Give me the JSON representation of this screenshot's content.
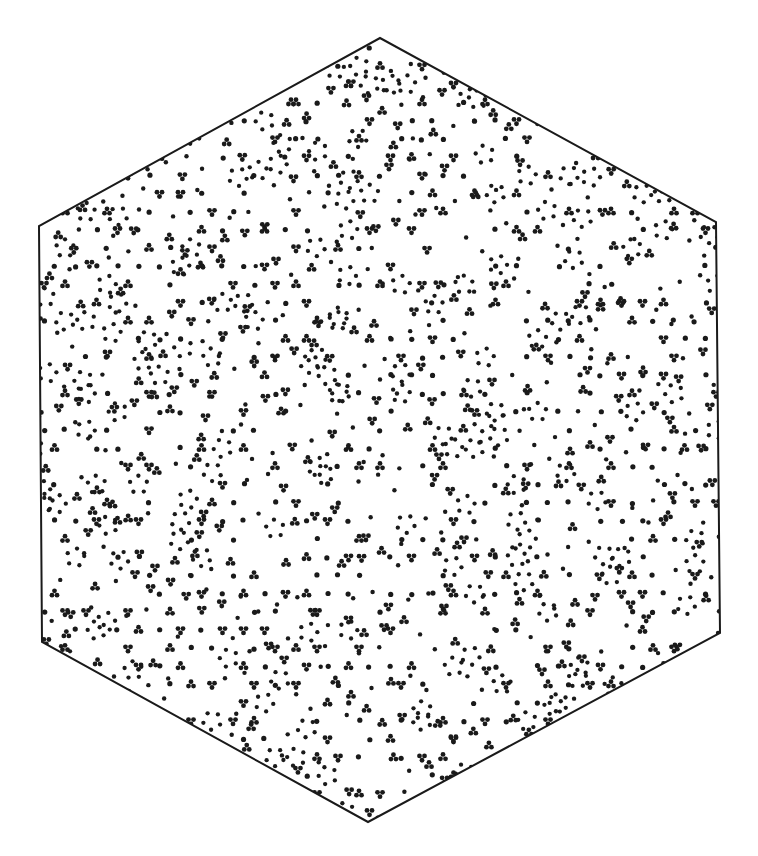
{
  "figure": {
    "description": "Hexagonal region filled with a quasiperiodic dot pattern (single dots, triplet clusters and rings)",
    "background_color": "#ffffff",
    "ink_color": "#1a1a1a",
    "outline_color": "#1a1a1a",
    "outline_width": 2,
    "hexagon_vertices": [
      [
        380,
        38
      ],
      [
        716,
        222
      ],
      [
        720,
        633
      ],
      [
        368,
        822
      ],
      [
        42,
        642
      ],
      [
        39,
        226
      ]
    ],
    "pattern": {
      "type": "quasiperiodic-dot-tiling",
      "seed": 137,
      "lattice_spacing": 21,
      "dot_radius": 2.6,
      "cluster_dot_radius": 2.4,
      "single_dot_probability": 0.55,
      "triplet_probability": 0.18,
      "ring_probability": 0.06,
      "rotation_deg": 12
    }
  }
}
